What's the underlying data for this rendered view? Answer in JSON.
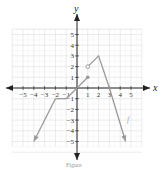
{
  "chart_data": {
    "type": "line",
    "title": "",
    "xlabel": "x",
    "ylabel": "y",
    "xlim": [
      -6,
      6
    ],
    "ylim": [
      -6,
      6
    ],
    "grid": true,
    "x_ticks": [
      "−5",
      "−4",
      "−3",
      "−2",
      "−1",
      "1",
      "2",
      "3",
      "4",
      "5"
    ],
    "y_ticks": [
      "5",
      "4",
      "3",
      "2",
      "1",
      "−1",
      "−2",
      "−3",
      "−4",
      "−5"
    ],
    "series": [
      {
        "name": "f",
        "segments": [
          {
            "points": [
              [
                -4,
                -5
              ],
              [
                -2,
                -1
              ]
            ],
            "start": "arrow",
            "end": "none"
          },
          {
            "points": [
              [
                -2,
                -1
              ],
              [
                -1,
                -1
              ]
            ],
            "start": "none",
            "end": "none"
          },
          {
            "points": [
              [
                -1,
                -1
              ],
              [
                0,
                0
              ],
              [
                1,
                1
              ]
            ],
            "start": "none",
            "end": "closed"
          },
          {
            "points": [
              [
                1,
                2
              ],
              [
                2,
                3
              ],
              [
                3,
                0
              ],
              [
                4.5,
                -5
              ]
            ],
            "start": "open",
            "end": "arrow"
          }
        ]
      }
    ],
    "annotations": [
      {
        "text": "f",
        "x": 4.6,
        "y": -2.8
      }
    ],
    "caption": "Figure"
  }
}
